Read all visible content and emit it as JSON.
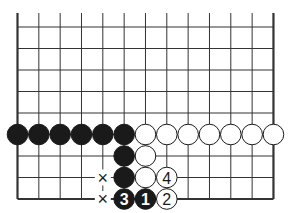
{
  "diagram": {
    "type": "go-board-fragment",
    "columns": 13,
    "rows_visible": 9,
    "edges": [
      "left",
      "right",
      "bottom"
    ],
    "colors": {
      "line": "#333333",
      "black": "#1a1a1a",
      "white": "#ffffff",
      "text_on_black": "#ffffff",
      "text_on_white": "#1a1a1a"
    },
    "stones": [
      {
        "col": 0,
        "row": 5,
        "color": "black",
        "label": ""
      },
      {
        "col": 1,
        "row": 5,
        "color": "black",
        "label": ""
      },
      {
        "col": 2,
        "row": 5,
        "color": "black",
        "label": ""
      },
      {
        "col": 3,
        "row": 5,
        "color": "black",
        "label": ""
      },
      {
        "col": 4,
        "row": 5,
        "color": "black",
        "label": ""
      },
      {
        "col": 5,
        "row": 5,
        "color": "black",
        "label": ""
      },
      {
        "col": 6,
        "row": 5,
        "color": "white",
        "label": ""
      },
      {
        "col": 7,
        "row": 5,
        "color": "white",
        "label": ""
      },
      {
        "col": 8,
        "row": 5,
        "color": "white",
        "label": ""
      },
      {
        "col": 9,
        "row": 5,
        "color": "white",
        "label": ""
      },
      {
        "col": 10,
        "row": 5,
        "color": "white",
        "label": ""
      },
      {
        "col": 11,
        "row": 5,
        "color": "white",
        "label": ""
      },
      {
        "col": 12,
        "row": 5,
        "color": "white",
        "label": ""
      },
      {
        "col": 5,
        "row": 6,
        "color": "black",
        "label": ""
      },
      {
        "col": 6,
        "row": 6,
        "color": "white",
        "label": ""
      },
      {
        "col": 5,
        "row": 7,
        "color": "black",
        "label": ""
      },
      {
        "col": 6,
        "row": 7,
        "color": "white",
        "label": ""
      },
      {
        "col": 7,
        "row": 7,
        "color": "white",
        "label": "4"
      },
      {
        "col": 5,
        "row": 8,
        "color": "black",
        "label": "3"
      },
      {
        "col": 6,
        "row": 8,
        "color": "black",
        "label": "1"
      },
      {
        "col": 7,
        "row": 8,
        "color": "white",
        "label": "2"
      }
    ],
    "marks": [
      {
        "col": 4,
        "row": 7,
        "symbol": "×"
      },
      {
        "col": 4,
        "row": 8,
        "symbol": "×"
      }
    ]
  }
}
